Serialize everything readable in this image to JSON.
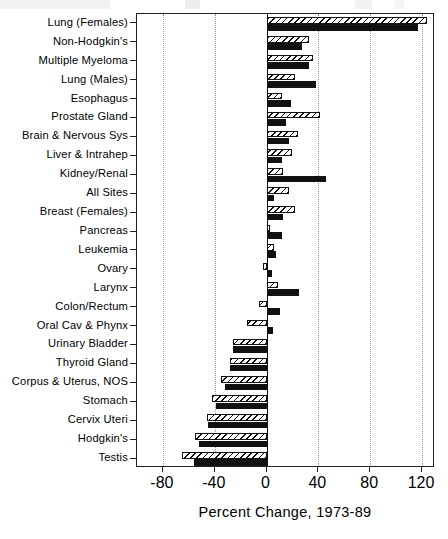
{
  "chart_data": {
    "type": "bar",
    "orientation": "horizontal",
    "title": "",
    "xlabel": "Percent Change, 1973-89",
    "ylabel": "",
    "xlim": [
      -100,
      130
    ],
    "xticks": [
      -80,
      -40,
      0,
      40,
      80,
      120
    ],
    "xticklabels": [
      "-80",
      "-40",
      "0",
      "40",
      "80",
      "120"
    ],
    "grid": "vertical-dotted",
    "zero_reference_line": 0,
    "legend": "none",
    "categories": [
      "Lung (Females)",
      "Non-Hodgkin's",
      "Multiple Myeloma",
      "Lung (Males)",
      "Esophagus",
      "Prostate Gland",
      "Brain & Nervous Sys",
      "Liver & Intrahep",
      "Kidney/Renal",
      "All Sites",
      "Breast (Females)",
      "Pancreas",
      "Leukemia",
      "Ovary",
      "Larynx",
      "Colon/Rectum",
      "Oral Cav & Phynx",
      "Urinary Bladder",
      "Thyroid Gland",
      "Corpus & Uterus, NOS",
      "Stomach",
      "Cervix Uteri",
      "Hodgkin's",
      "Testis"
    ],
    "series": [
      {
        "name": "Incidence",
        "style": "hatched",
        "values": [
          124,
          33,
          36,
          22,
          12,
          41,
          24,
          20,
          13,
          17,
          22,
          3,
          6,
          -3,
          9,
          -6,
          -15,
          -26,
          -28,
          -35,
          -42,
          -46,
          -55,
          -65
        ]
      },
      {
        "name": "Mortality",
        "style": "solid-black",
        "values": [
          117,
          27,
          33,
          38,
          19,
          15,
          17,
          12,
          46,
          6,
          13,
          12,
          7,
          4,
          25,
          10,
          5,
          -26,
          -28,
          -32,
          -39,
          -45,
          -52,
          -56
        ]
      }
    ]
  },
  "axis": {
    "x_title": "Percent Change, 1973-89"
  }
}
